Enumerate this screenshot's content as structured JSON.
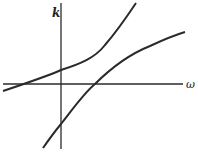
{
  "diagram": {
    "axes": {
      "vertical_label": "k",
      "horizontal_label": "ω"
    },
    "curves": [
      {
        "name": "upper-branch",
        "description": "increasing convex curve crossing ω-axis at negative ω and k-axis at positive k"
      },
      {
        "name": "lower-branch",
        "description": "increasing concave curve crossing k-axis at negative k and ω-axis at positive ω"
      }
    ],
    "colors": {
      "stroke": "#2a2a2a",
      "background": "#ffffff"
    }
  }
}
